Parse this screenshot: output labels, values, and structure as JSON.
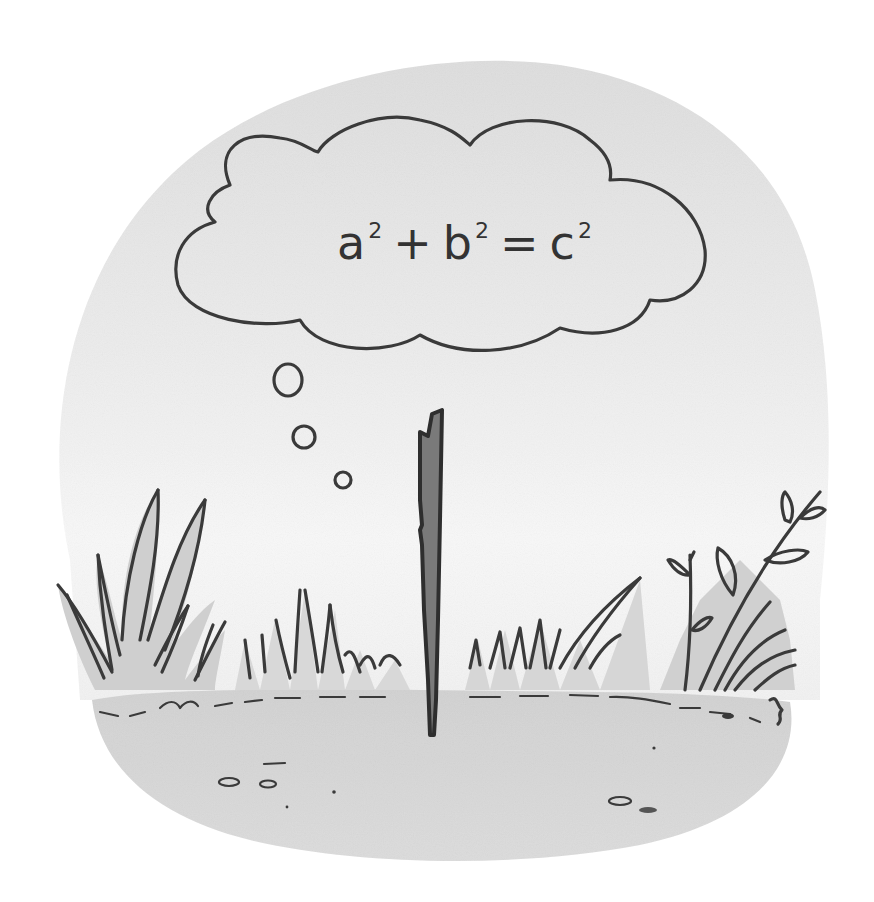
{
  "illustration": {
    "style": "grayscale watercolor cartoon",
    "colors": {
      "background": "#ffffff",
      "sky_wash": "#e4e4e4",
      "ground_wash": "#d6d6d6",
      "ink": "#3a3a3a",
      "stick_fill": "#7a7a7a",
      "grass_fill": "#cfcfcf",
      "leaf_fill": "#a9a9a9"
    },
    "thought_bubble": {
      "equation": {
        "term1_base": "a",
        "term1_exp": "2",
        "op1": "+",
        "term2_base": "b",
        "term2_exp": "2",
        "op2": "=",
        "term3_base": "c",
        "term3_exp": "2"
      },
      "trail_bubbles": 3
    },
    "subjects": {
      "stick": "upright stick planted in the ground",
      "left_grass": "tall grass clump",
      "middle_grass": "short grass tufts",
      "right_plant": "leafy sprigs with grass"
    }
  }
}
